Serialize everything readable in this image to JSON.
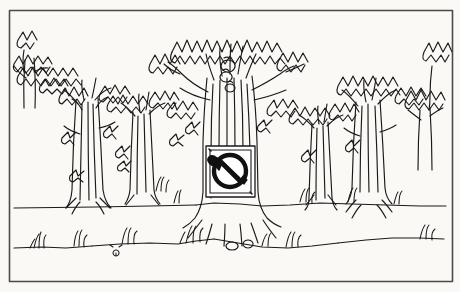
{
  "artwork": {
    "title": "Forest with no-axe prohibition sign",
    "medium": "black-and-white pen-and-ink line drawing",
    "caption_text": "",
    "paper_color": "#fdfdfb",
    "ink_color": "#1a1a1a",
    "frame": {
      "name": "rectangular-border",
      "color": "#4a4a4a",
      "x": 9,
      "y": 10,
      "width": 443,
      "height": 271,
      "stroke_width": 1.6
    },
    "scene": {
      "ground_line_y": 208,
      "horizon_label": "forest floor",
      "sky_color": "#fdfdfb"
    },
    "sign": {
      "name": "no-axe-prohibition-sign",
      "meaning": "no logging / do not cut trees",
      "symbol": "axe with prohibition circle-slash",
      "plate_color": "#ffffff",
      "border_color": "#1a1a1a",
      "x": 205,
      "y": 145,
      "width": 50,
      "height": 52
    },
    "trees": [
      {
        "name": "tree-far-left",
        "trunk_x": 30,
        "canopy": "sparse-left-edge"
      },
      {
        "name": "tree-left",
        "trunk_x": 88,
        "canopy": "spiky-cluster"
      },
      {
        "name": "tree-mid-left",
        "trunk_x": 140,
        "canopy": "spiky-cluster"
      },
      {
        "name": "tree-center-sign",
        "trunk_x": 228,
        "canopy": "large-dense-crown"
      },
      {
        "name": "tree-mid-right",
        "trunk_x": 320,
        "canopy": "spiky-cluster"
      },
      {
        "name": "tree-right",
        "trunk_x": 370,
        "canopy": "spiky-cluster"
      },
      {
        "name": "tree-far-right",
        "trunk_x": 424,
        "canopy": "sparse-right-edge"
      }
    ],
    "grass_tufts": 11
  }
}
